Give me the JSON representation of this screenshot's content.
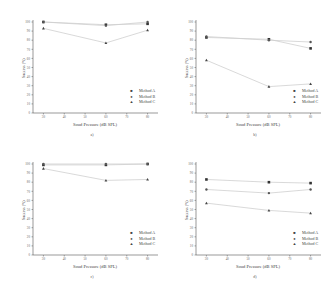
{
  "chart_data": [
    {
      "panel": "a)",
      "type": "line",
      "xlabel": "Soud Pressure (dB SPL)",
      "ylabel": "Success (%)",
      "x_ticks": [
        30,
        40,
        50,
        60,
        70,
        80
      ],
      "y_ticks": [
        0,
        10,
        20,
        30,
        40,
        50,
        60,
        70,
        80,
        90,
        100
      ],
      "ylim": [
        0,
        100
      ],
      "x": [
        30,
        60,
        80
      ],
      "series": [
        {
          "name": "Method A",
          "marker": "square",
          "values": [
            100,
            97,
            98
          ]
        },
        {
          "name": "Method B",
          "marker": "circle",
          "values": [
            100,
            96,
            100
          ]
        },
        {
          "name": "Method C",
          "marker": "triangle",
          "values": [
            93,
            77,
            91
          ]
        }
      ],
      "legend_position": "lower right",
      "grid": false
    },
    {
      "panel": "b)",
      "type": "line",
      "xlabel": "Soud Pressure (dB SPL)",
      "ylabel": "Success (%)",
      "x_ticks": [
        30,
        40,
        50,
        60,
        70,
        80
      ],
      "y_ticks": [
        0,
        10,
        20,
        30,
        40,
        50,
        60,
        70,
        80,
        90,
        100
      ],
      "ylim": [
        0,
        100
      ],
      "x": [
        30,
        60,
        80
      ],
      "series": [
        {
          "name": "Method A",
          "marker": "square",
          "values": [
            83,
            81,
            71
          ]
        },
        {
          "name": "Method B",
          "marker": "circle",
          "values": [
            84,
            80,
            78
          ]
        },
        {
          "name": "Method C",
          "marker": "triangle",
          "values": [
            58,
            29,
            32
          ]
        }
      ],
      "legend_position": "lower right",
      "grid": false
    },
    {
      "panel": "c)",
      "type": "line",
      "xlabel": "Soud Pressure (dB SPL)",
      "ylabel": "Success (%)",
      "x_ticks": [
        30,
        40,
        50,
        60,
        70,
        80
      ],
      "y_ticks": [
        0,
        10,
        20,
        30,
        40,
        50,
        60,
        70,
        80,
        90,
        100
      ],
      "ylim": [
        0,
        100
      ],
      "x": [
        30,
        60,
        80
      ],
      "series": [
        {
          "name": "Method A",
          "marker": "square",
          "values": [
            99,
            99,
            100
          ]
        },
        {
          "name": "Method B",
          "marker": "circle",
          "values": [
            100,
            100,
            100
          ]
        },
        {
          "name": "Method C",
          "marker": "triangle",
          "values": [
            95,
            82,
            83
          ]
        }
      ],
      "legend_position": "lower right",
      "grid": false
    },
    {
      "panel": "d)",
      "type": "line",
      "xlabel": "Soud Pressure (dB SPL)",
      "ylabel": "Success (%)",
      "x_ticks": [
        30,
        40,
        50,
        60,
        70,
        80
      ],
      "y_ticks": [
        0,
        10,
        20,
        30,
        40,
        50,
        60,
        70,
        80,
        90,
        100
      ],
      "ylim": [
        0,
        100
      ],
      "x": [
        30,
        60,
        80
      ],
      "series": [
        {
          "name": "Method A",
          "marker": "square",
          "values": [
            83,
            80,
            79
          ]
        },
        {
          "name": "Method B",
          "marker": "circle",
          "values": [
            72,
            68,
            72
          ]
        },
        {
          "name": "Method C",
          "marker": "triangle",
          "values": [
            57,
            49,
            46
          ]
        }
      ],
      "legend_position": "lower right",
      "grid": false
    }
  ],
  "legend_symbols": {
    "square": "■",
    "circle": "●",
    "triangle": "▲"
  },
  "colors": {
    "axis": "#555555",
    "marker": "#333333",
    "line": "#cfcfcf"
  }
}
